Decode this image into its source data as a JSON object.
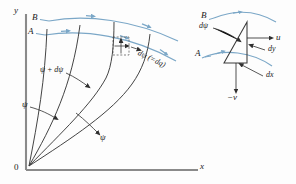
{
  "figure": {
    "axes": {
      "y_label": "y",
      "x_label": "x",
      "origin_label": "0",
      "axis_color": "#8a8a8a"
    },
    "colors": {
      "streamline_blue": "#7ba7c7",
      "curve_black": "#3a3a3a",
      "text": "#1b1b1b",
      "axis": "#8a8a8a",
      "background": "#fdfdfd"
    },
    "left_panel": {
      "name": "main-flow-diagram",
      "arcs": [
        {
          "id": "arc-B",
          "label": "B",
          "role": "outer-streamline"
        },
        {
          "id": "arc-A",
          "label": "A",
          "role": "inner-streamline"
        }
      ],
      "streamline_labels": [
        {
          "id": "psi-lower-left",
          "text": "ψ"
        },
        {
          "id": "psi-plus-dpsi",
          "text": "ψ + dψ"
        },
        {
          "id": "psi-lower-right",
          "text": "ψ"
        }
      ],
      "detail_callout": {
        "id": "dpsi-equals-dq",
        "text": "dψ (=dq)",
        "box": "dashed-detail-box"
      }
    },
    "right_panel": {
      "name": "control-volume-detail",
      "arcs": [
        {
          "id": "arc-B-detail",
          "label": "B"
        },
        {
          "id": "arc-A-detail",
          "label": "A"
        }
      ],
      "labels": [
        {
          "id": "dpsi",
          "text": "dψ"
        },
        {
          "id": "u-velocity",
          "text": "u"
        },
        {
          "id": "dy-side",
          "text": "dy"
        },
        {
          "id": "dx-side",
          "text": "dx"
        },
        {
          "id": "minus-v-velocity",
          "text": "−v"
        }
      ]
    }
  }
}
